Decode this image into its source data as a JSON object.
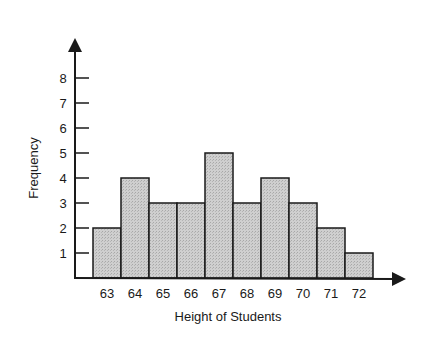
{
  "chart_data": {
    "type": "bar",
    "title": "",
    "xlabel": "Height of Students",
    "ylabel": "Frequency",
    "categories": [
      "63",
      "64",
      "65",
      "66",
      "67",
      "68",
      "69",
      "70",
      "71",
      "72"
    ],
    "values": [
      2,
      4,
      3,
      3,
      5,
      3,
      4,
      3,
      2,
      1
    ],
    "yticks": [
      1,
      2,
      3,
      4,
      5,
      6,
      7,
      8
    ],
    "ylim": [
      0,
      9
    ],
    "grid": false,
    "legend": null,
    "style": "histogram",
    "bar_color": "#c8c8c8",
    "edge_color": "#1a1a1a"
  }
}
